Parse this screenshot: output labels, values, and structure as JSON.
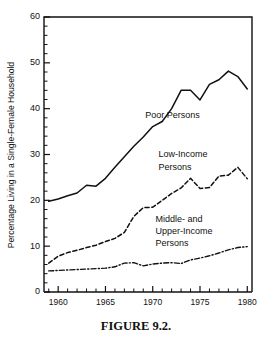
{
  "figure": {
    "caption": "FIGURE 9.2."
  },
  "chart_data": {
    "type": "line",
    "title": "",
    "xlabel": "",
    "ylabel": "Percentage Living in a Single-Female Household",
    "xlim": [
      1958.5,
      1980.5
    ],
    "ylim": [
      0,
      60
    ],
    "grid": false,
    "legend_position": "inline-annotations",
    "y_ticks_major": [
      0,
      10,
      20,
      30,
      40,
      50,
      60
    ],
    "y_tick_labels": [
      "0",
      "10",
      "20",
      "30",
      "40",
      "50",
      "60"
    ],
    "y_minor_step": 2,
    "x_ticks_major": [
      1960,
      1965,
      1970,
      1975,
      1980
    ],
    "x_tick_labels": [
      "1960",
      "1965",
      "1970",
      "1975",
      "1980"
    ],
    "x_minor_step": 1,
    "x": [
      1959,
      1960,
      1961,
      1962,
      1963,
      1964,
      1965,
      1966,
      1967,
      1968,
      1969,
      1970,
      1971,
      1972,
      1973,
      1974,
      1975,
      1976,
      1977,
      1978,
      1979,
      1980
    ],
    "series": [
      {
        "name": "Poor Persons",
        "line_style": "solid",
        "label_x": 1969.2,
        "label_y": 38.0,
        "values": [
          19.8,
          20.3,
          21.0,
          21.6,
          23.3,
          23.1,
          24.8,
          27.2,
          29.5,
          31.8,
          33.8,
          36.1,
          37.2,
          40.0,
          44.0,
          44.0,
          41.9,
          45.3,
          46.3,
          48.2,
          47.0,
          44.3
        ]
      },
      {
        "name": "Low-Income Persons",
        "line_style": "dashed",
        "label_x": 1970.6,
        "label_y": 29.4,
        "label_line2_y": 26.7,
        "values": [
          6.3,
          7.8,
          8.6,
          9.1,
          9.7,
          10.2,
          11.0,
          11.7,
          13.0,
          16.5,
          18.4,
          18.5,
          20.0,
          21.5,
          22.7,
          24.8,
          22.6,
          22.8,
          25.3,
          25.5,
          27.2,
          24.7
        ]
      },
      {
        "name": "Middle- and Upper-Income Persons",
        "line_style": "dashdot",
        "label_x": 1970.3,
        "label_y": 15.3,
        "values": [
          4.6,
          4.7,
          4.8,
          4.9,
          5.0,
          5.1,
          5.2,
          5.5,
          6.3,
          6.4,
          5.7,
          6.1,
          6.3,
          6.4,
          6.2,
          7.0,
          7.4,
          7.9,
          8.5,
          9.2,
          9.7,
          9.9
        ]
      }
    ],
    "annotations": [
      {
        "text": "Poor Persons",
        "x": 1969.2,
        "y": 38.0
      },
      {
        "text": "Low-Income",
        "x": 1970.6,
        "y": 29.4
      },
      {
        "text": "Persons",
        "x": 1970.6,
        "y": 26.7
      },
      {
        "text": "Middle- and",
        "x": 1970.3,
        "y": 15.3
      },
      {
        "text": "Upper-Income",
        "x": 1970.3,
        "y": 12.7
      },
      {
        "text": "Persons",
        "x": 1970.3,
        "y": 10.1
      }
    ]
  }
}
